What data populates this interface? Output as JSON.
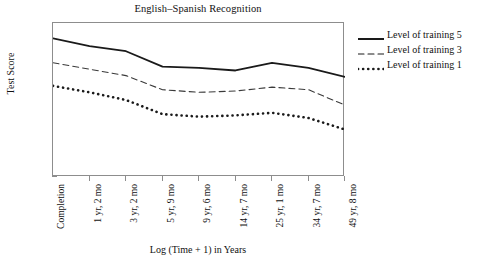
{
  "chart_data": {
    "type": "line",
    "title": "English–Spanish Recognition",
    "xlabel": "Log (Time + 1) in Years",
    "ylabel": "Test Score",
    "ylim": [
      0,
      12
    ],
    "yticks": [
      0,
      2,
      4,
      6,
      8,
      10,
      12
    ],
    "grid": false,
    "legend_position": "right",
    "categories": [
      "Completion",
      "1 yr, 2 mo",
      "3 yr, 2 mo",
      "5 yr, 9 mo",
      "9 yr, 6 mo",
      "14 yr, 7 mo",
      "25 yr, 1 mo",
      "34 yr, 7 mo",
      "49 yr, 8 mo"
    ],
    "series": [
      {
        "name": "Level of training 5",
        "style": "solid",
        "color": "#1a1a1a",
        "values": [
          10.8,
          10.2,
          9.8,
          8.6,
          8.5,
          8.3,
          8.9,
          8.5,
          7.8
        ]
      },
      {
        "name": "Level of training 3",
        "style": "dashed",
        "color": "#3a3a3a",
        "values": [
          8.9,
          8.4,
          7.9,
          6.8,
          6.6,
          6.7,
          7.0,
          6.8,
          5.6
        ]
      },
      {
        "name": "Level of training 1",
        "style": "dotted",
        "color": "#1a1a1a",
        "values": [
          7.1,
          6.6,
          6.0,
          4.9,
          4.7,
          4.8,
          5.0,
          4.6,
          3.7
        ]
      }
    ]
  },
  "legend": {
    "items": [
      {
        "label": "Level of training 5",
        "style": "solid"
      },
      {
        "label": "Level of training 3",
        "style": "dashed"
      },
      {
        "label": "Level of training 1",
        "style": "dotted"
      }
    ]
  }
}
